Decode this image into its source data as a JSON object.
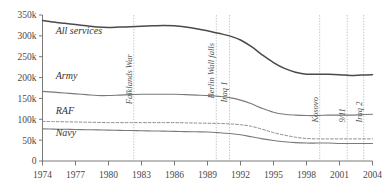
{
  "chart_data": {
    "type": "line",
    "title": "",
    "subtitle": "",
    "xlabel": "",
    "ylabel": "",
    "xlim": [
      1974,
      2004
    ],
    "ylim": [
      0,
      350000
    ],
    "grid": "event-vertical-only",
    "legend_position": "inline-labels",
    "y_ticks": [
      0,
      50000,
      100000,
      150000,
      200000,
      250000,
      300000,
      350000
    ],
    "y_tick_labels": [
      "0",
      "50k",
      "100k",
      "150k",
      "200k",
      "250k",
      "300k",
      "350k"
    ],
    "x_ticks": [
      1974,
      1977,
      1980,
      1983,
      1986,
      1989,
      1992,
      1995,
      1998,
      2001,
      2004
    ],
    "x_tick_labels": [
      "1974",
      "1977",
      "1980",
      "1983",
      "1986",
      "1989",
      "1992",
      "1995",
      "1998",
      "2001",
      "2004"
    ],
    "x": [
      1974,
      1975,
      1976,
      1977,
      1978,
      1979,
      1980,
      1981,
      1982,
      1983,
      1984,
      1985,
      1986,
      1987,
      1988,
      1989,
      1990,
      1991,
      1992,
      1993,
      1994,
      1995,
      1996,
      1997,
      1998,
      1999,
      2000,
      2001,
      2002,
      2003,
      2004
    ],
    "series": [
      {
        "name": "All services",
        "color": "#4a4a4a",
        "style": "solid",
        "width": 1.5,
        "label_x": 1975.2,
        "label_y": 305000,
        "values": [
          337000,
          333000,
          330000,
          327000,
          324000,
          321000,
          320000,
          321000,
          322000,
          323000,
          324000,
          325000,
          324000,
          321000,
          317000,
          312000,
          306000,
          300000,
          290000,
          274000,
          254000,
          236000,
          222000,
          213000,
          208000,
          208000,
          208000,
          207000,
          205000,
          206000,
          207000
        ]
      },
      {
        "name": "Army",
        "color": "#7a7a7a",
        "style": "solid",
        "width": 1.1,
        "label_x": 1975.2,
        "label_y": 196000,
        "values": [
          167000,
          165000,
          163000,
          161000,
          159000,
          157000,
          157000,
          158000,
          159000,
          160000,
          160000,
          160000,
          160000,
          159000,
          158000,
          157000,
          155000,
          152000,
          146000,
          137000,
          126000,
          117000,
          112000,
          110000,
          109000,
          109000,
          110000,
          110000,
          110000,
          111000,
          112000
        ]
      },
      {
        "name": "RAF",
        "color": "#8a8a8a",
        "style": "dashed",
        "width": 1.0,
        "label_x": 1975.2,
        "label_y": 112000,
        "values": [
          95000,
          94500,
          94000,
          93500,
          93000,
          92500,
          92000,
          92000,
          92000,
          92000,
          92000,
          92000,
          92000,
          91500,
          91000,
          90500,
          90000,
          89000,
          87000,
          83000,
          76000,
          68000,
          62000,
          57000,
          54000,
          53000,
          53000,
          53000,
          53000,
          53000,
          53000
        ]
      },
      {
        "name": "Navy",
        "color": "#7a7a7a",
        "style": "solid",
        "width": 1.1,
        "label_x": 1975.2,
        "label_y": 60000,
        "values": [
          77000,
          76500,
          76000,
          75500,
          75000,
          74500,
          74000,
          73500,
          73000,
          72500,
          72000,
          71500,
          71000,
          70500,
          70000,
          69500,
          68000,
          66000,
          63000,
          58000,
          53000,
          49000,
          46000,
          44000,
          43000,
          43000,
          43000,
          42000,
          42000,
          42000,
          42000
        ]
      }
    ],
    "events": [
      {
        "name": "Falklands War",
        "year": 1982.3,
        "label": "Falklands War",
        "label_y": 136000
      },
      {
        "name": "Berlin Wall falls",
        "year": 1989.8,
        "label": "Berlin Wall falls",
        "label_y": 150000
      },
      {
        "name": "Iraq 1",
        "year": 1991.0,
        "label": "Iraq 1",
        "label_y": 140000
      },
      {
        "name": "Kosovo",
        "year": 1999.2,
        "label": "Kosovo",
        "label_y": 92000
      },
      {
        "name": "9/11",
        "year": 2001.7,
        "label": "9/11",
        "label_y": 92000
      },
      {
        "name": "Iraq 2",
        "year": 2003.2,
        "label": "Iraq 2",
        "label_y": 92000
      }
    ]
  },
  "colors": {
    "axis": "#6b6b6b",
    "gridline": "#b9b9b9",
    "background": "#ffffff",
    "text": "#4a4a4a"
  }
}
